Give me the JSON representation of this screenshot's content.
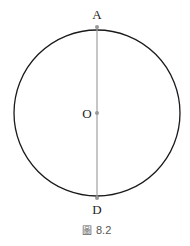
{
  "figure": {
    "points": {
      "A": "A",
      "O": "O",
      "D": "D"
    },
    "caption_prefix": "圖",
    "caption_number": "8.2",
    "colors": {
      "circle": "#1a1a1a",
      "diameter": "#a0a0a0",
      "point": "#999999"
    }
  }
}
